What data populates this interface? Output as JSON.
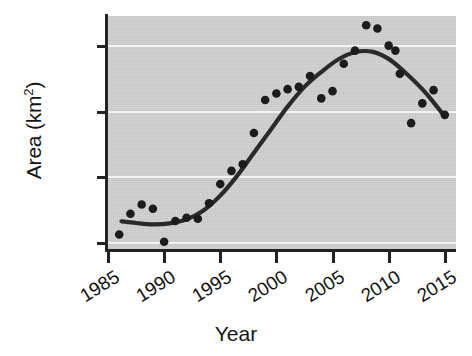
{
  "chart_data": {
    "type": "scatter",
    "title": "",
    "xlabel": "Year",
    "ylabel": "Area (km2)",
    "ylabel_base": "Area (km",
    "ylabel_sup": "2",
    "ylabel_close": ")",
    "xlim": [
      1985,
      2016
    ],
    "ylim": [
      580,
      1290
    ],
    "xticks": [
      1985,
      1990,
      1995,
      2000,
      2005,
      2010,
      2015
    ],
    "xtick_labels": [
      "1985",
      "1990",
      "1995",
      "2000",
      "2005",
      "2010",
      "2015"
    ],
    "yticks": [
      600,
      800,
      1000,
      1200
    ],
    "ytick_labels": [
      "600",
      "800",
      "1000",
      "1200"
    ],
    "grid": "horizontal-white",
    "legend": "none",
    "plot_bg_color": "#d2d2d2",
    "gridline_color": "#f4f4f4",
    "point_color": "#1c1c1c",
    "curve_color": "#2a2a2a",
    "axis_color": "#232323",
    "point_label": "observed-area",
    "curve_label": "smoothed-trend",
    "x": [
      1986,
      1987,
      1988,
      1989,
      1990,
      1991,
      1992,
      1993,
      1994,
      1995,
      1996,
      1997,
      1998,
      1999,
      2000,
      2001,
      2002,
      2003,
      2004,
      2005,
      2006,
      2007,
      2008,
      2009,
      2010,
      2010.6,
      2011,
      2012,
      2013,
      2014,
      2015
    ],
    "y": [
      627,
      690,
      718,
      705,
      605,
      668,
      678,
      675,
      722,
      780,
      820,
      840,
      935,
      1035,
      1055,
      1068,
      1075,
      1108,
      1040,
      1062,
      1145,
      1185,
      1262,
      1252,
      1200,
      1185,
      1115,
      965,
      1025,
      1065,
      990
    ],
    "series": [
      {
        "name": "observed-area",
        "points": [
          {
            "year": 1986,
            "area": 627
          },
          {
            "year": 1987,
            "area": 690
          },
          {
            "year": 1988,
            "area": 718
          },
          {
            "year": 1989,
            "area": 705
          },
          {
            "year": 1990,
            "area": 605
          },
          {
            "year": 1991,
            "area": 668
          },
          {
            "year": 1992,
            "area": 678
          },
          {
            "year": 1993,
            "area": 675
          },
          {
            "year": 1994,
            "area": 722
          },
          {
            "year": 1995,
            "area": 780
          },
          {
            "year": 1996,
            "area": 820
          },
          {
            "year": 1997,
            "area": 840
          },
          {
            "year": 1998,
            "area": 935
          },
          {
            "year": 1999,
            "area": 1035
          },
          {
            "year": 2000,
            "area": 1055
          },
          {
            "year": 2001,
            "area": 1068
          },
          {
            "year": 2002,
            "area": 1075
          },
          {
            "year": 2003,
            "area": 1108
          },
          {
            "year": 2004,
            "area": 1040
          },
          {
            "year": 2005,
            "area": 1062
          },
          {
            "year": 2006,
            "area": 1145
          },
          {
            "year": 2007,
            "area": 1185
          },
          {
            "year": 2008,
            "area": 1262
          },
          {
            "year": 2009,
            "area": 1252
          },
          {
            "year": 2010,
            "area": 1200
          },
          {
            "year": 2010.6,
            "area": 1185
          },
          {
            "year": 2011,
            "area": 1115
          },
          {
            "year": 2012,
            "area": 965
          },
          {
            "year": 2013,
            "area": 1025
          },
          {
            "year": 2014,
            "area": 1065
          },
          {
            "year": 2015,
            "area": 990
          }
        ]
      }
    ],
    "fit_curve": {
      "name": "smoothed-trend",
      "points": [
        {
          "year": 1986.2,
          "area": 667
        },
        {
          "year": 1987.5,
          "area": 662
        },
        {
          "year": 1989,
          "area": 658
        },
        {
          "year": 1990.5,
          "area": 661
        },
        {
          "year": 1992,
          "area": 673
        },
        {
          "year": 1993.5,
          "area": 700
        },
        {
          "year": 1995,
          "area": 745
        },
        {
          "year": 1996.5,
          "area": 805
        },
        {
          "year": 1998,
          "area": 875
        },
        {
          "year": 1999.5,
          "area": 945
        },
        {
          "year": 2001,
          "area": 1015
        },
        {
          "year": 2002.5,
          "area": 1075
        },
        {
          "year": 2004,
          "area": 1120
        },
        {
          "year": 2005.5,
          "area": 1158
        },
        {
          "year": 2007,
          "area": 1180
        },
        {
          "year": 2008.5,
          "area": 1182
        },
        {
          "year": 2010,
          "area": 1160
        },
        {
          "year": 2011.5,
          "area": 1118
        },
        {
          "year": 2013,
          "area": 1068
        },
        {
          "year": 2014,
          "area": 1028
        },
        {
          "year": 2015,
          "area": 985
        }
      ]
    }
  }
}
